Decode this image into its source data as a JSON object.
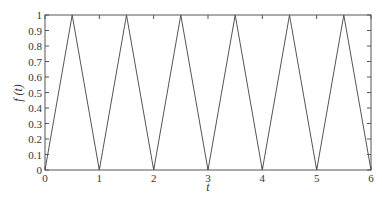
{
  "chart_data": {
    "type": "line",
    "title": "",
    "xlabel": "t",
    "ylabel": "f (t)",
    "xlim": [
      0,
      6
    ],
    "ylim": [
      0,
      1
    ],
    "grid": false,
    "legend": null,
    "x_ticks": [
      "0",
      "1",
      "2",
      "3",
      "4",
      "5",
      "6"
    ],
    "y_ticks": [
      "0",
      "0.1",
      "0.2",
      "0.3",
      "0.4",
      "0.5",
      "0.6",
      "0.7",
      "0.8",
      "0.9",
      "1"
    ],
    "series": [
      {
        "name": "f(t)",
        "x": [
          0,
          0.5,
          1,
          1.5,
          2,
          2.5,
          3,
          3.5,
          4,
          4.5,
          5,
          5.5,
          6
        ],
        "y": [
          0,
          1,
          0,
          1,
          0,
          1,
          0,
          1,
          0,
          1,
          0,
          1,
          0
        ]
      }
    ]
  },
  "colors": {
    "line": "#555555",
    "axes": "#555555",
    "background": "#ffffff"
  }
}
